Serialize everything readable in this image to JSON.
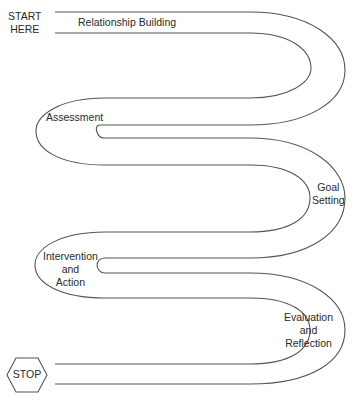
{
  "diagram": {
    "type": "serpentine-path",
    "start_label": [
      "START",
      "HERE"
    ],
    "stop_label": "STOP",
    "stages": [
      {
        "label": [
          "Relationship Building"
        ]
      },
      {
        "label": [
          "Assessment"
        ]
      },
      {
        "label": [
          "Goal",
          "Setting"
        ]
      },
      {
        "label": [
          "Intervention",
          "and",
          "Action"
        ]
      },
      {
        "label": [
          "Evaluation",
          "and",
          "Reflection"
        ]
      }
    ],
    "colors": {
      "line": "#555555",
      "text": "#2a2a2a",
      "background": "#ffffff"
    }
  }
}
